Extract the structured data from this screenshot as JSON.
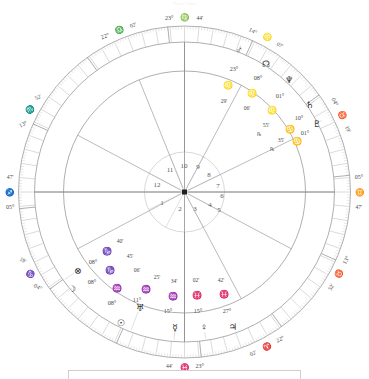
{
  "header": {
    "caption": "Natal Chart"
  },
  "chart_data": {
    "type": "wheel",
    "geometry": {
      "cx": 184.5,
      "cy": 192,
      "r_outer": 166,
      "r_zodiac": 150,
      "r_house": 121,
      "r_inner": 40
    },
    "angles": [
      {
        "name": "MC",
        "deg": "23°",
        "sign": "virgo",
        "glyph": "♍",
        "min": "44'",
        "x": 184,
        "y": 25,
        "dx_deg": -26,
        "dx_glyph": 0,
        "dx_min": 22,
        "rot": 0
      },
      {
        "name": "ASC",
        "deg": "05°",
        "sign": "sagittarius",
        "glyph": "♐",
        "min": "47'",
        "x": 22,
        "y": 192,
        "dy_deg": -16,
        "dy_glyph": 0,
        "dy_min": 16,
        "rot": 0
      },
      {
        "name": "DSC",
        "deg": "05°",
        "sign": "gemini",
        "glyph": "♊",
        "min": "47'",
        "x": 348,
        "y": 192,
        "dy_deg": -16,
        "dy_glyph": 0,
        "dy_min": 16,
        "rot": 0
      },
      {
        "name": "IC",
        "deg": "23°",
        "sign": "pisces",
        "glyph": "♓",
        "min": "44'",
        "x": 184,
        "y": 358,
        "dx_deg": -26,
        "dx_glyph": 0,
        "dx_min": 22,
        "rot": 0
      }
    ],
    "house_cusps": [
      {
        "house": 11,
        "deg": "22°",
        "sign": "libra",
        "glyph": "♎",
        "min": "02'",
        "angle_deg": 112,
        "rot": -22
      },
      {
        "house": 10,
        "deg": "23°",
        "sign": "virgo",
        "glyph": "♍",
        "min": "44'",
        "angle_deg": 90,
        "rot": 0
      },
      {
        "house": 9,
        "deg": "14°",
        "sign": "leo",
        "glyph": "♌",
        "min": "07'",
        "angle_deg": 62,
        "rot": 28
      },
      {
        "house": 8,
        "deg": "04°",
        "sign": "taurus",
        "glyph": "♉",
        "min": "19'",
        "angle_deg": 26,
        "rot": 64
      },
      {
        "house": 7,
        "deg": "05°",
        "sign": "gemini",
        "glyph": "♊",
        "min": "47'",
        "angle_deg": 0,
        "rot": 0
      },
      {
        "house": 6,
        "deg": "13°",
        "sign": "taurus",
        "glyph": "♉",
        "min": "52'",
        "angle_deg": -28,
        "rot": -62
      },
      {
        "house": 5,
        "deg": "22°",
        "sign": "aries",
        "glyph": "♈",
        "min": "02'",
        "angle_deg": -62,
        "rot": -28
      },
      {
        "house": 4,
        "deg": "23°",
        "sign": "pisces",
        "glyph": "♓",
        "min": "44'",
        "angle_deg": -90,
        "rot": 0
      },
      {
        "house": 3,
        "deg": "04°",
        "sign": "capricorn",
        "glyph": "♑",
        "min": "19'",
        "angle_deg": -152,
        "rot": 28
      },
      {
        "house": 2,
        "deg": "13°",
        "sign": "scorpio",
        "glyph": "♏",
        "min": "52'",
        "angle_deg": 152,
        "rot": -28
      },
      {
        "house": 1,
        "deg": "05°",
        "sign": "sagittarius",
        "glyph": "♐",
        "min": "47'",
        "angle_deg": 180,
        "rot": 0
      }
    ],
    "house_numbers": [
      {
        "n": "1",
        "x": 162,
        "y": 203
      },
      {
        "n": "2",
        "x": 180,
        "y": 209
      },
      {
        "n": "3",
        "x": 195,
        "y": 209
      },
      {
        "n": "4",
        "x": 210,
        "y": 205
      },
      {
        "n": "5",
        "x": 219,
        "y": 210
      },
      {
        "n": "6",
        "x": 222,
        "y": 196
      },
      {
        "n": "7",
        "x": 218,
        "y": 186
      },
      {
        "n": "8",
        "x": 209,
        "y": 175
      },
      {
        "n": "9",
        "x": 198,
        "y": 167
      },
      {
        "n": "10",
        "x": 184,
        "y": 166
      },
      {
        "n": "11",
        "x": 170,
        "y": 170
      },
      {
        "n": "12",
        "x": 157,
        "y": 185
      }
    ],
    "planets": [
      {
        "name": "mars",
        "glyph": "♂",
        "deg": "23°",
        "sign": "leo",
        "sign_glyph": "♌",
        "min": "29'",
        "retro": "",
        "gx": 239,
        "gy": 50,
        "dx": 234,
        "dy": 68,
        "sx": 228,
        "sy": 85,
        "mx": 224,
        "my": 101,
        "rx_x": 0,
        "rx_y": 0
      },
      {
        "name": "north-node",
        "glyph": "☊",
        "deg": "08°",
        "sign": "leo",
        "sign_glyph": "♌",
        "min": "06'",
        "retro": "",
        "gx": 266,
        "gy": 63,
        "dx": 258,
        "dy": 77,
        "sx": 252,
        "sy": 93,
        "mx": 247,
        "my": 108,
        "rx_x": 0,
        "rx_y": 0
      },
      {
        "name": "neptune",
        "glyph": "♆",
        "deg": "01°",
        "sign": "leo",
        "sign_glyph": "♌",
        "min": "55'",
        "retro": "℞",
        "gx": 289,
        "gy": 79,
        "dx": 280,
        "dy": 95,
        "sx": 272,
        "sy": 110,
        "mx": 266,
        "my": 125,
        "rx_x": 259,
        "rx_y": 134
      },
      {
        "name": "saturn",
        "glyph": "♄",
        "deg": "10°",
        "sign": "cancer",
        "sign_glyph": "♋",
        "min": "35'",
        "retro": "℞",
        "gx": 310,
        "gy": 104,
        "dx": 299,
        "dy": 117,
        "sx": 290,
        "sy": 129,
        "mx": 281,
        "my": 140,
        "rx_x": 272,
        "rx_y": 149
      },
      {
        "name": "pluto",
        "glyph": "♇",
        "deg": "01°",
        "sign": "cancer",
        "sign_glyph": "♋",
        "min": "",
        "retro": "",
        "gx": 317,
        "gy": 123,
        "dx": 305,
        "dy": 132,
        "sx": 297,
        "sy": 141,
        "mx": 0,
        "my": 0,
        "rx_x": 0,
        "rx_y": 0
      },
      {
        "name": "part-of-fortune",
        "glyph": "⊗",
        "deg": "08°",
        "sign": "capricorn",
        "sign_glyph": "♑",
        "min": "40'",
        "retro": "",
        "gx": 78,
        "gy": 270,
        "dx": 93,
        "dy": 261,
        "sx": 107,
        "sy": 251,
        "mx": 120,
        "my": 241,
        "rx_x": 0,
        "rx_y": 0
      },
      {
        "name": "moon",
        "glyph": "☽",
        "deg": "08°",
        "sign": "capricorn",
        "sign_glyph": "♑",
        "min": "45'",
        "retro": "",
        "gx": 72,
        "gy": 288,
        "dx": 92,
        "dy": 281,
        "sx": 110,
        "sy": 270,
        "mx": 130,
        "my": 256,
        "rx_x": 0,
        "rx_y": 0
      },
      {
        "name": "sun",
        "glyph": "☉",
        "deg": "08°",
        "sign": "aquarius",
        "sign_glyph": "♒",
        "min": "06'",
        "retro": "",
        "gx": 121,
        "gy": 322,
        "dx": 112,
        "dy": 302,
        "sx": 117,
        "sy": 288,
        "mx": 137,
        "my": 270,
        "rx_x": 149,
        "rx_y": 267
      },
      {
        "name": "uranus",
        "glyph": "♅",
        "deg": "11°",
        "sign": "aquarius",
        "sign_glyph": "♒",
        "min": "25'",
        "retro": "",
        "gx": 140,
        "gy": 307,
        "dx": 137,
        "dy": 299,
        "sx": 146,
        "sy": 289,
        "mx": 157,
        "my": 277,
        "rx_x": 0,
        "rx_y": 0
      },
      {
        "name": "mercury",
        "glyph": "☿",
        "deg": "15°",
        "sign": "aquarius",
        "sign_glyph": "♒",
        "min": "34'",
        "retro": "",
        "gx": 175,
        "gy": 327,
        "dx": 168,
        "dy": 310,
        "sx": 173,
        "sy": 296,
        "mx": 174,
        "my": 281,
        "rx_x": 0,
        "rx_y": 0
      },
      {
        "name": "venus",
        "glyph": "♀",
        "deg": "15°",
        "sign": "pisces",
        "sign_glyph": "♓",
        "min": "02'",
        "retro": "",
        "gx": 204,
        "gy": 327,
        "dx": 198,
        "dy": 310,
        "sx": 197,
        "sy": 295,
        "mx": 196,
        "my": 280,
        "rx_x": 0,
        "rx_y": 0
      },
      {
        "name": "jupiter",
        "glyph": "♃",
        "deg": "27°",
        "sign": "pisces",
        "sign_glyph": "♓",
        "min": "42'",
        "retro": "",
        "gx": 233,
        "gy": 326,
        "dx": 227,
        "dy": 310,
        "sx": 224,
        "sy": 294,
        "mx": 221,
        "my": 280,
        "rx_x": 0,
        "rx_y": 0
      }
    ],
    "legend": "",
    "colors": {
      "line": "#8d8d8d",
      "line_light": "#bdbdbd",
      "text": "#4a4a4a",
      "background": "#ffffff"
    }
  }
}
